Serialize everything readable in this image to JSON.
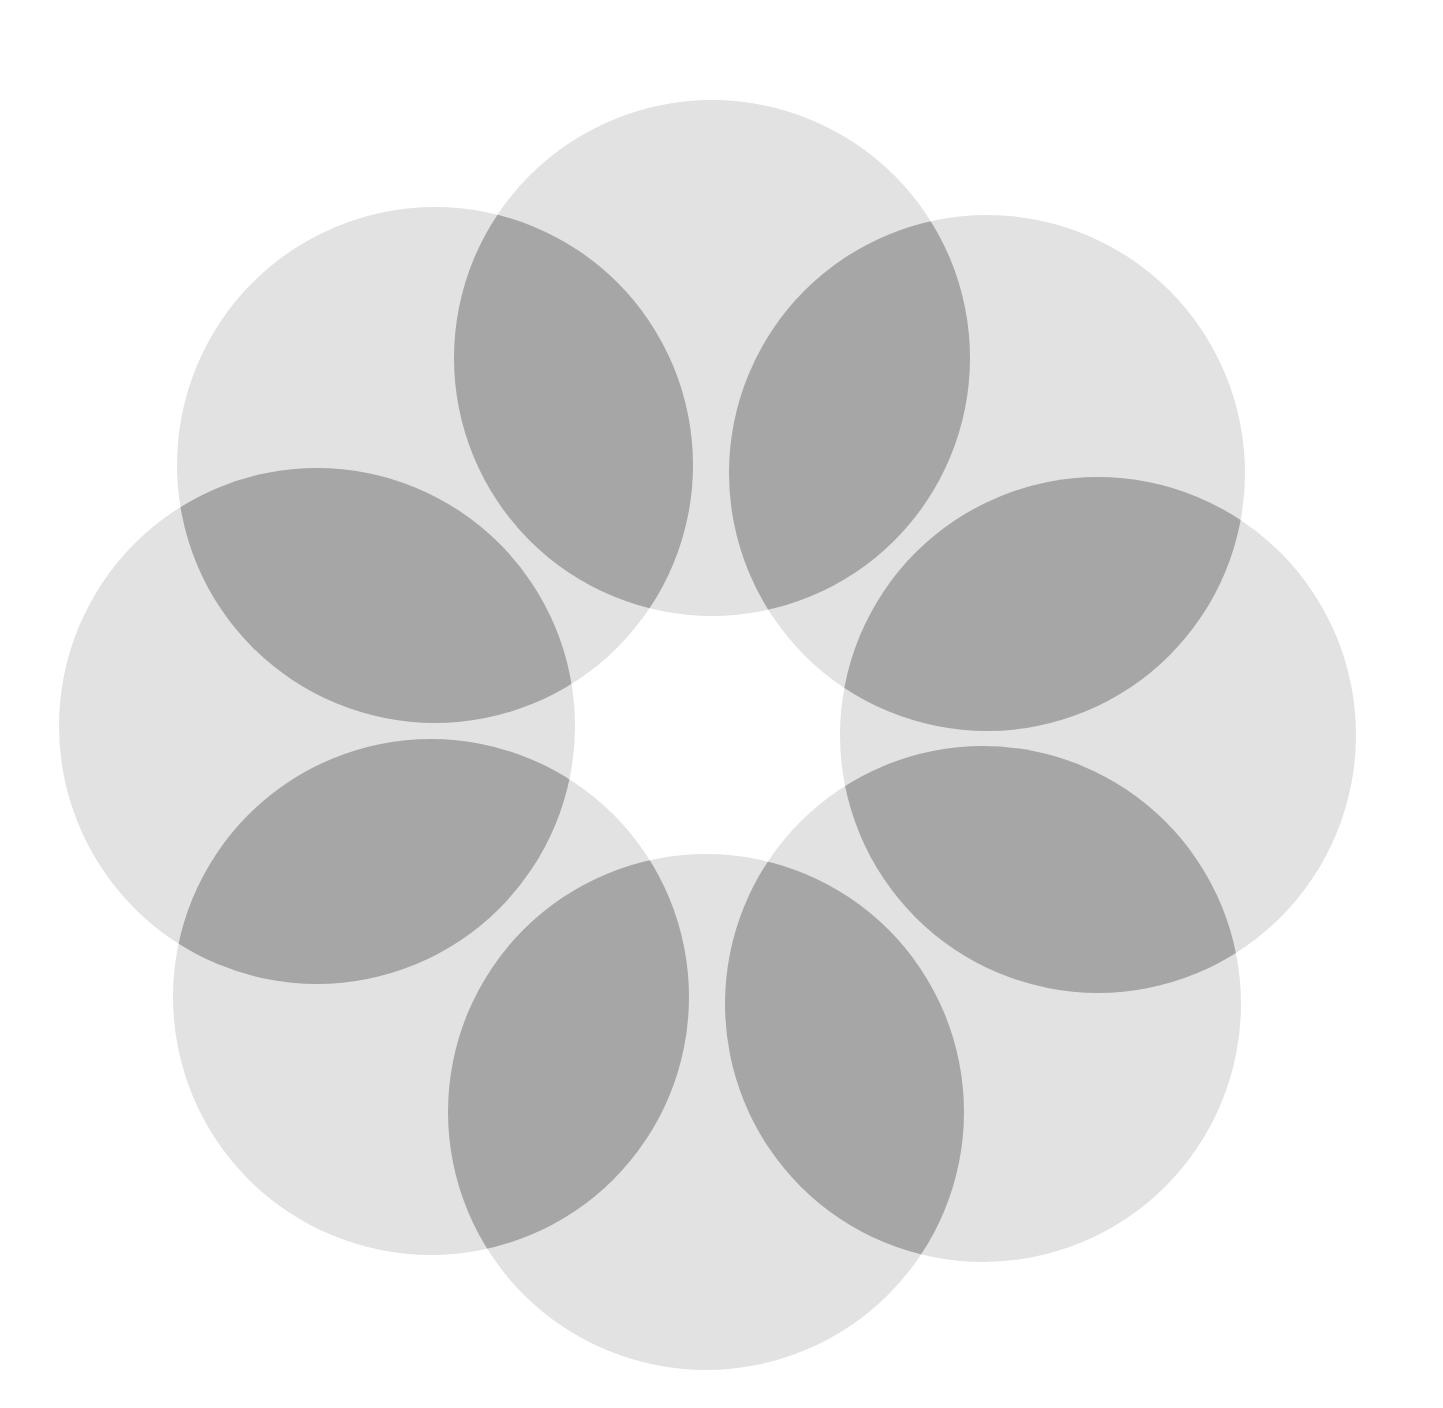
{
  "figure": {
    "background": "#ffffff",
    "circle_fill": "#e2e2e2",
    "overlap_fill": "#a6a6a6",
    "radius": 258,
    "circles": [
      {
        "cx": 712,
        "cy": 358
      },
      {
        "cx": 987,
        "cy": 473
      },
      {
        "cx": 1098,
        "cy": 735
      },
      {
        "cx": 983,
        "cy": 1004
      },
      {
        "cx": 706,
        "cy": 1112
      },
      {
        "cx": 431,
        "cy": 997
      },
      {
        "cx": 317,
        "cy": 726
      },
      {
        "cx": 435,
        "cy": 465
      }
    ]
  }
}
